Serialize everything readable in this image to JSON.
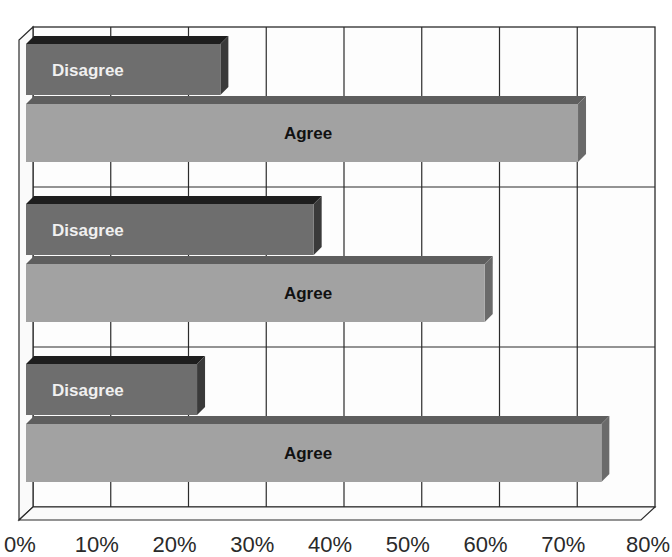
{
  "chart_data": {
    "type": "bar",
    "orientation": "horizontal",
    "style": "3d-clustered",
    "title": "",
    "xlabel": "",
    "ylabel": "",
    "xlim": [
      0,
      80
    ],
    "x_ticks": [
      "0%",
      "10%",
      "20%",
      "30%",
      "40%",
      "50%",
      "60%",
      "70%",
      "80%"
    ],
    "grid": true,
    "legend": "none (series labels drawn inside bars)",
    "categories": [
      "Group 1",
      "Group 2",
      "Group 3"
    ],
    "series": [
      {
        "name": "Disagree",
        "values": [
          25,
          37,
          22
        ],
        "color": "#6e6e6e",
        "label_color": "#f2f2f2"
      },
      {
        "name": "Agree",
        "values": [
          71,
          59,
          74
        ],
        "color": "#a2a2a2",
        "label_color": "#111111"
      }
    ]
  },
  "labels": {
    "disagree": "Disagree",
    "agree": "Agree"
  },
  "colors": {
    "grid": "#2b2b2b",
    "disagree_face": "#6e6e6e",
    "disagree_top": "#1e1e1e",
    "disagree_side": "#3a3a3a",
    "agree_face": "#a2a2a2",
    "agree_top": "#5e5e5e",
    "agree_side": "#6a6a6a"
  }
}
